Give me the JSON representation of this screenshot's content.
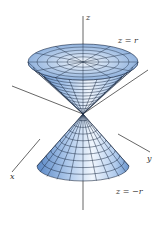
{
  "figure": {
    "axes": {
      "z_label": "z",
      "x_label": "x",
      "y_label": "y"
    },
    "surfaces": [
      {
        "name": "upper-cone",
        "equation": "z = r"
      },
      {
        "name": "lower-cone",
        "equation": "z = −r"
      }
    ],
    "colors": {
      "surface_light": "#eef4fc",
      "surface_mid": "#a9c6ea",
      "surface_dark": "#4f7fc0",
      "mesh_line": "#1d2c44",
      "axis_line": "#555555",
      "label_text": "#333333",
      "background": "#ffffff"
    }
  }
}
